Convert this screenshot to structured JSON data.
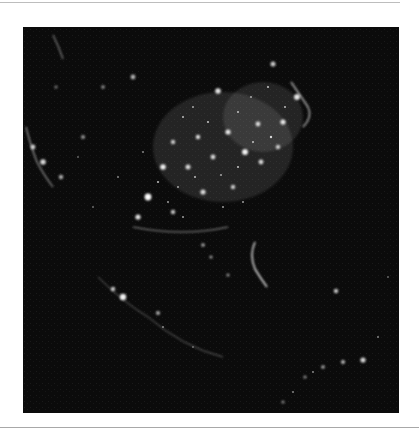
{
  "figure": {
    "background_color": "#0b0b0b",
    "light_color": "#ffffff"
  },
  "light_clusters": [
    {
      "cx": 175,
      "cy": 110,
      "r": 2.2,
      "o": 0.9
    },
    {
      "cx": 110,
      "cy": 50,
      "r": 2.4,
      "o": 0.7
    },
    {
      "cx": 195,
      "cy": 64,
      "r": 2.8,
      "o": 0.9
    },
    {
      "cx": 250,
      "cy": 37,
      "r": 2.5,
      "o": 0.8
    },
    {
      "cx": 274,
      "cy": 70,
      "r": 3.0,
      "o": 0.9
    },
    {
      "cx": 260,
      "cy": 95,
      "r": 2.6,
      "o": 0.9
    },
    {
      "cx": 235,
      "cy": 97,
      "r": 2.4,
      "o": 0.85
    },
    {
      "cx": 205,
      "cy": 105,
      "r": 2.6,
      "o": 0.9
    },
    {
      "cx": 222,
      "cy": 125,
      "r": 3.0,
      "o": 0.95
    },
    {
      "cx": 190,
      "cy": 130,
      "r": 2.4,
      "o": 0.85
    },
    {
      "cx": 165,
      "cy": 140,
      "r": 2.5,
      "o": 0.85
    },
    {
      "cx": 140,
      "cy": 140,
      "r": 2.8,
      "o": 0.95
    },
    {
      "cx": 150,
      "cy": 115,
      "r": 2.2,
      "o": 0.8
    },
    {
      "cx": 125,
      "cy": 170,
      "r": 3.4,
      "o": 1.0
    },
    {
      "cx": 115,
      "cy": 190,
      "r": 2.6,
      "o": 0.9
    },
    {
      "cx": 150,
      "cy": 185,
      "r": 2.2,
      "o": 0.8
    },
    {
      "cx": 180,
      "cy": 165,
      "r": 2.6,
      "o": 0.85
    },
    {
      "cx": 210,
      "cy": 160,
      "r": 2.2,
      "o": 0.8
    },
    {
      "cx": 238,
      "cy": 135,
      "r": 2.4,
      "o": 0.85
    },
    {
      "cx": 255,
      "cy": 120,
      "r": 2.2,
      "o": 0.8
    },
    {
      "cx": 10,
      "cy": 120,
      "r": 2.4,
      "o": 0.8
    },
    {
      "cx": 20,
      "cy": 135,
      "r": 2.8,
      "o": 0.85
    },
    {
      "cx": 38,
      "cy": 150,
      "r": 2.2,
      "o": 0.7
    },
    {
      "cx": 60,
      "cy": 110,
      "r": 2.0,
      "o": 0.6
    },
    {
      "cx": 80,
      "cy": 60,
      "r": 1.8,
      "o": 0.6
    },
    {
      "cx": 33,
      "cy": 60,
      "r": 1.6,
      "o": 0.5
    },
    {
      "cx": 100,
      "cy": 270,
      "r": 3.2,
      "o": 0.95
    },
    {
      "cx": 90,
      "cy": 262,
      "r": 2.2,
      "o": 0.8
    },
    {
      "cx": 135,
      "cy": 286,
      "r": 2.0,
      "o": 0.7
    },
    {
      "cx": 205,
      "cy": 248,
      "r": 1.6,
      "o": 0.6
    },
    {
      "cx": 313,
      "cy": 264,
      "r": 2.2,
      "o": 0.8
    },
    {
      "cx": 340,
      "cy": 333,
      "r": 2.6,
      "o": 0.85
    },
    {
      "cx": 320,
      "cy": 335,
      "r": 2.0,
      "o": 0.75
    },
    {
      "cx": 300,
      "cy": 340,
      "r": 1.8,
      "o": 0.7
    },
    {
      "cx": 282,
      "cy": 350,
      "r": 1.6,
      "o": 0.6
    },
    {
      "cx": 260,
      "cy": 375,
      "r": 1.6,
      "o": 0.55
    },
    {
      "cx": 180,
      "cy": 218,
      "r": 1.8,
      "o": 0.7
    },
    {
      "cx": 188,
      "cy": 230,
      "r": 1.6,
      "o": 0.65
    }
  ]
}
